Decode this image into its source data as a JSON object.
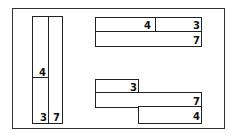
{
  "diagram": {
    "title": "",
    "vertical_model": {
      "left_column_segments": [
        {
          "label": "4"
        },
        {
          "label": "3"
        }
      ],
      "right_column": {
        "label": "7"
      }
    },
    "top_right_model": {
      "top_row": [
        {
          "label": "4"
        },
        {
          "label": "3"
        }
      ],
      "bottom_row": {
        "label": "7"
      }
    },
    "bottom_right_model": {
      "upper_bar": {
        "label": "3"
      },
      "middle_bar": {
        "label": "7"
      },
      "lower_bar": {
        "label": "4"
      }
    }
  }
}
